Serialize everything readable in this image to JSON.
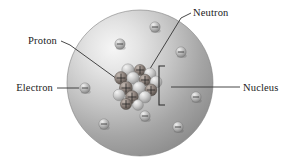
{
  "figure": {
    "background_color": "#ffffff",
    "width": 290,
    "height": 166
  },
  "atom": {
    "name": "atom-sphere",
    "center": {
      "x": 140,
      "y": 83
    },
    "radius": 73,
    "highlight_color": "#f4f4f4",
    "midtone_color": "#c9c9c9",
    "shadow_color": "#8a8a8a",
    "edge_color": "#7d7d7d",
    "light_source": "upper-left"
  },
  "labels": [
    {
      "key": "proton",
      "text": "Proton",
      "anchor": "end",
      "x": 57,
      "y": 44,
      "leader": "M61,41 L70,45 L128,87",
      "leader_style": "diagonal"
    },
    {
      "key": "electron",
      "text": "Electron",
      "anchor": "end",
      "x": 53,
      "y": 91,
      "leader": "M57,88 L79,88",
      "leader_style": "horizontal"
    },
    {
      "key": "neutron",
      "text": "Neutron",
      "anchor": "start",
      "x": 193,
      "y": 16,
      "leader": "M191,13 L181,18 L148,72",
      "leader_style": "diagonal"
    },
    {
      "key": "nucleus",
      "text": "Nucleus",
      "anchor": "start",
      "x": 243,
      "y": 91,
      "leader": "M171,87 L240,87",
      "leader_style": "horizontal"
    }
  ],
  "nucleus_bracket": {
    "name": "nucleus-bracket",
    "path": "M165,66 L159,66 L159,105 L165,105",
    "color": "#2b2b2b"
  },
  "electrons": {
    "charge_sign": "−",
    "fill_light": "#e8e8e8",
    "fill_dark": "#8f8f8f",
    "radius": 5.2,
    "count": 8,
    "positions": [
      {
        "x": 120,
        "y": 44
      },
      {
        "x": 155,
        "y": 27
      },
      {
        "x": 181,
        "y": 52
      },
      {
        "x": 85,
        "y": 88
      },
      {
        "x": 104,
        "y": 124
      },
      {
        "x": 145,
        "y": 116
      },
      {
        "x": 178,
        "y": 127
      },
      {
        "x": 196,
        "y": 97
      }
    ]
  },
  "nucleons": {
    "proton": {
      "label": "proton",
      "charge_sign": "+",
      "fill_light": "#b4aaa4",
      "fill_dark": "#5d5550",
      "count": 11
    },
    "neutron": {
      "label": "neutron",
      "charge_sign": "",
      "fill_light": "#ececec",
      "fill_dark": "#9a9a9a",
      "count": 11
    },
    "cluster_center": {
      "x": 137,
      "y": 86
    },
    "cluster_radius": 22,
    "particles": [
      {
        "type": "neutron",
        "x": 128,
        "y": 70,
        "r": 6.2
      },
      {
        "type": "proton",
        "x": 140,
        "y": 70,
        "r": 5.6
      },
      {
        "type": "neutron",
        "x": 150,
        "y": 74,
        "r": 6.0
      },
      {
        "type": "proton",
        "x": 121,
        "y": 78,
        "r": 6.4
      },
      {
        "type": "neutron",
        "x": 133,
        "y": 78,
        "r": 6.2
      },
      {
        "type": "proton",
        "x": 145,
        "y": 80,
        "r": 5.8
      },
      {
        "type": "neutron",
        "x": 156,
        "y": 82,
        "r": 6.0
      },
      {
        "type": "proton",
        "x": 126,
        "y": 88,
        "r": 6.6
      },
      {
        "type": "neutron",
        "x": 139,
        "y": 88,
        "r": 6.4
      },
      {
        "type": "proton",
        "x": 151,
        "y": 90,
        "r": 6.0
      },
      {
        "type": "neutron",
        "x": 119,
        "y": 95,
        "r": 5.8
      },
      {
        "type": "proton",
        "x": 132,
        "y": 97,
        "r": 6.4
      },
      {
        "type": "neutron",
        "x": 145,
        "y": 97,
        "r": 6.0
      },
      {
        "type": "proton",
        "x": 126,
        "y": 104,
        "r": 5.6
      },
      {
        "type": "neutron",
        "x": 138,
        "y": 105,
        "r": 5.4
      }
    ]
  }
}
